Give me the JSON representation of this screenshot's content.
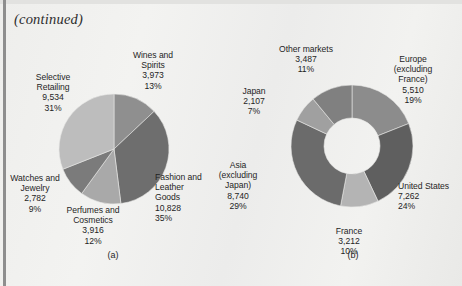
{
  "page": {
    "continued_note": "(continued)",
    "background_color": "#efefed",
    "text_color": "#1f1f1f"
  },
  "chart_data": [
    {
      "id": "chart-a",
      "type": "pie",
      "caption": "(a)",
      "title": "",
      "unit": "EUR millions",
      "total": 31033,
      "legend_position": "outside-labels",
      "categories": [
        "Wines and Spirits",
        "Fashion and Leather Goods",
        "Perfumes and Cosmetics",
        "Watches and Jewelry",
        "Selective Retailing"
      ],
      "values": [
        3973,
        10828,
        3916,
        2782,
        9534
      ],
      "percents": [
        13,
        35,
        12,
        9,
        31
      ],
      "colors": [
        "#8f8f8f",
        "#6e6e6e",
        "#a9a9a9",
        "#7b7b7b",
        "#bdbdbd"
      ],
      "slices": [
        {
          "name": "Wines and Spirits",
          "value": "3,973",
          "percent": "13%",
          "label": "Wines and\nSpirits\n3,973\n13%",
          "color": "#8f8f8f",
          "start_deg": 0,
          "sweep_deg": 46.8
        },
        {
          "name": "Fashion and Leather Goods",
          "value": "10,828",
          "percent": "35%",
          "label": "Fashion and\nLeather\nGoods\n10,828\n35%",
          "color": "#6e6e6e",
          "start_deg": 46.8,
          "sweep_deg": 126.0
        },
        {
          "name": "Perfumes and Cosmetics",
          "value": "3,916",
          "percent": "12%",
          "label": "Perfumes and\nCosmetics\n3,916\n12%",
          "color": "#a9a9a9",
          "start_deg": 172.8,
          "sweep_deg": 43.2
        },
        {
          "name": "Watches and Jewelry",
          "value": "2,782",
          "percent": "9%",
          "label": "Watches and\nJewelry\n2,782\n9%",
          "color": "#7b7b7b",
          "start_deg": 216.0,
          "sweep_deg": 32.4
        },
        {
          "name": "Selective Retailing",
          "value": "9,534",
          "percent": "31%",
          "label": "Selective\nRetailing\n9,534\n31%",
          "color": "#bdbdbd",
          "start_deg": 248.4,
          "sweep_deg": 111.6
        }
      ]
    },
    {
      "id": "chart-b",
      "type": "pie",
      "variant": "donut",
      "caption": "(b)",
      "title": "",
      "unit": "EUR millions",
      "total": 30318,
      "legend_position": "outside-labels",
      "categories": [
        "Europe (excluding France)",
        "United States",
        "France",
        "Asia (excluding Japan)",
        "Japan",
        "Other markets"
      ],
      "values": [
        5510,
        7262,
        3212,
        8740,
        2107,
        3487
      ],
      "percents": [
        19,
        24,
        10,
        29,
        7,
        11
      ],
      "colors": [
        "#8c8c8c",
        "#5f5f5f",
        "#b4b4b4",
        "#6b6b6b",
        "#a0a0a0",
        "#808080"
      ],
      "inner_color": "#f2f2f0",
      "slices": [
        {
          "name": "Europe (excluding France)",
          "value": "5,510",
          "percent": "19%",
          "label": "Europe\n(excluding\nFrance)\n5,510\n19%",
          "color": "#8c8c8c",
          "start_deg": 0,
          "sweep_deg": 68.4
        },
        {
          "name": "United States",
          "value": "7,262",
          "percent": "24%",
          "label": "United States\n7,262\n24%",
          "color": "#5f5f5f",
          "start_deg": 68.4,
          "sweep_deg": 86.4
        },
        {
          "name": "France",
          "value": "3,212",
          "percent": "10%",
          "label": "France\n3,212\n10%",
          "color": "#b4b4b4",
          "start_deg": 154.8,
          "sweep_deg": 36.0
        },
        {
          "name": "Asia (excluding Japan)",
          "value": "8,740",
          "percent": "29%",
          "label": "Asia\n(excluding\nJapan)\n8,740\n29%",
          "color": "#6b6b6b",
          "start_deg": 190.8,
          "sweep_deg": 104.4
        },
        {
          "name": "Japan",
          "value": "2,107",
          "percent": "7%",
          "label": "Japan\n2,107\n7%",
          "color": "#a0a0a0",
          "start_deg": 295.2,
          "sweep_deg": 25.2
        },
        {
          "name": "Other markets",
          "value": "3,487",
          "percent": "11%",
          "label": "Other markets\n3,487\n11%",
          "color": "#808080",
          "start_deg": 320.4,
          "sweep_deg": 39.6
        }
      ]
    }
  ]
}
